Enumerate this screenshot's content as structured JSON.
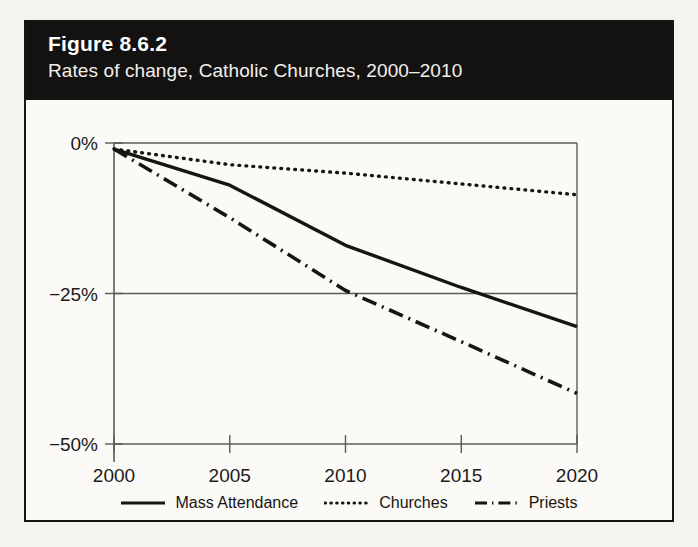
{
  "figure": {
    "number": "Figure 8.6.2",
    "subtitle": "Rates of change, Catholic Churches, 2000–2010"
  },
  "legend": {
    "items": [
      {
        "label": "Mass Attendance",
        "style": "solid"
      },
      {
        "label": "Churches",
        "style": "dotted"
      },
      {
        "label": "Priests",
        "style": "dash-dot"
      }
    ]
  },
  "chart_data": {
    "type": "line",
    "title": "Rates of change, Catholic Churches, 2000–2010",
    "xlabel": "",
    "ylabel": "",
    "x": [
      2000,
      2005,
      2010,
      2015,
      2020
    ],
    "xlim": [
      2000,
      2020
    ],
    "ylim": [
      -50,
      0
    ],
    "xticks": [
      "2000",
      "2005",
      "2010",
      "2015",
      "2020"
    ],
    "yticks": [
      "0%",
      "−25%",
      "−50%"
    ],
    "ytick_values": [
      0,
      -25,
      -50
    ],
    "grid": true,
    "legend_position": "bottom",
    "series": [
      {
        "name": "Mass Attendance",
        "style": "solid",
        "color": "#17150f",
        "values": [
          -1,
          -7,
          -17,
          -24,
          -30.5
        ]
      },
      {
        "name": "Churches",
        "style": "dotted",
        "color": "#17150f",
        "values": [
          -1,
          -3.6,
          -5,
          -6.8,
          -8.6
        ]
      },
      {
        "name": "Priests",
        "style": "dash-dot",
        "color": "#17150f",
        "values": [
          -1,
          -12.4,
          -24.5,
          -33,
          -41.6
        ]
      }
    ],
    "annotations": [
      {
        "text": "Priests crosses −25% near 2011"
      },
      {
        "text": "Mass Attendance crosses −25% near 2016"
      }
    ]
  }
}
